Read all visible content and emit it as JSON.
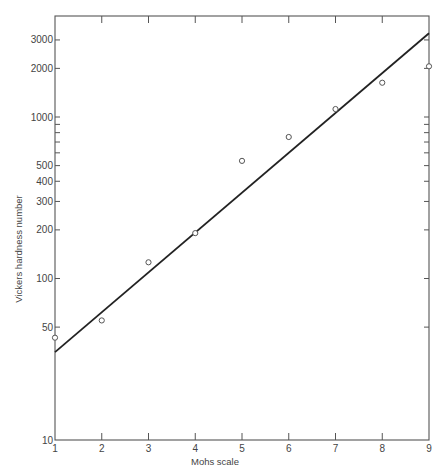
{
  "chart_data": {
    "type": "scatter",
    "title": "",
    "xlabel": "Mohs scale",
    "ylabel": "Vickers hardness number",
    "xscale": "linear",
    "yscale": "log",
    "xlim": [
      1,
      9
    ],
    "ylim": [
      10,
      4200
    ],
    "grid": false,
    "legend": null,
    "x_ticks": [
      1,
      2,
      3,
      4,
      5,
      6,
      7,
      8,
      9
    ],
    "x_tick_labels": [
      "1",
      "2",
      "3",
      "4",
      "5",
      "6",
      "7",
      "8",
      "9"
    ],
    "y_ticks_labeled": [
      10,
      50,
      100,
      200,
      300,
      400,
      500,
      1000,
      2000,
      3000
    ],
    "y_tick_labels": [
      "10",
      "50",
      "100",
      "200",
      "300",
      "400",
      "500",
      "1000",
      "2000",
      "3000"
    ],
    "y_ticks_minor": [
      600,
      700,
      800,
      900
    ],
    "series": [
      {
        "name": "Measured minerals",
        "marker": "open-circle",
        "x": [
          1,
          2,
          3,
          4,
          5,
          6,
          7,
          8,
          9
        ],
        "y": [
          43,
          55,
          126,
          191,
          535,
          752,
          1120,
          1630,
          2060
        ]
      },
      {
        "name": "Fitted line",
        "style": "solid-line",
        "x": [
          1,
          9
        ],
        "y": [
          35,
          3300
        ]
      }
    ]
  },
  "axes": {
    "x_title": "Mohs scale",
    "y_title": "Vickers hardness number"
  }
}
